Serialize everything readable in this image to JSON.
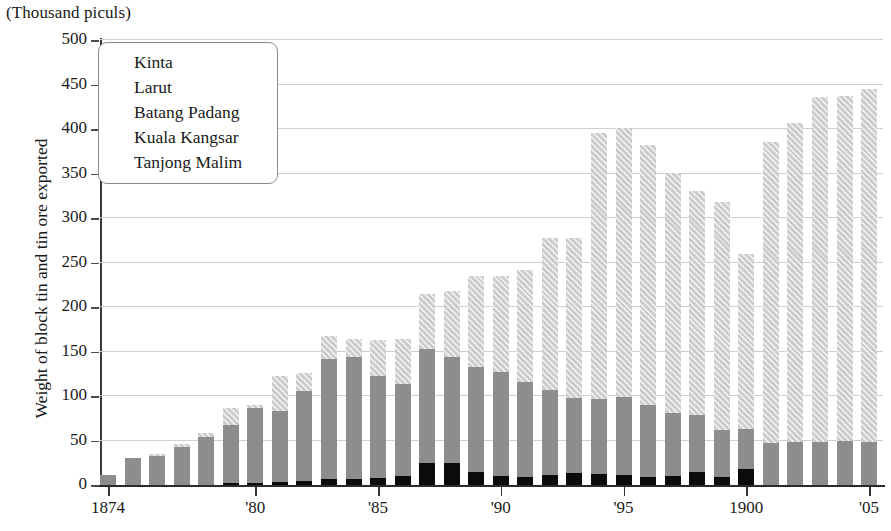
{
  "chart_data": {
    "type": "bar",
    "subtype": "stacked-bar",
    "title": "",
    "units_label": "(Thousand piculs)",
    "ylabel": "Weight of block tin and tin ore exported",
    "xlabel": "",
    "ylim": [
      0,
      500
    ],
    "ytick_labels": [
      "0",
      "50",
      "100",
      "150",
      "200",
      "250",
      "300",
      "350",
      "400",
      "450",
      "500"
    ],
    "ytick_values": [
      0,
      50,
      100,
      150,
      200,
      250,
      300,
      350,
      400,
      450,
      500
    ],
    "grid": true,
    "legend_position": "top-left",
    "x": [
      1874,
      1875,
      1876,
      1877,
      1878,
      1879,
      1880,
      1881,
      1882,
      1883,
      1884,
      1885,
      1886,
      1887,
      1888,
      1889,
      1890,
      1891,
      1892,
      1893,
      1894,
      1895,
      1896,
      1897,
      1898,
      1899,
      1900,
      1901,
      1902,
      1903,
      1904,
      1905
    ],
    "xtick_labels": [
      "1874",
      "'80",
      "'85",
      "'90",
      "'95",
      "1900",
      "'05"
    ],
    "xtick_values": [
      1874,
      1880,
      1885,
      1890,
      1895,
      1900,
      1905
    ],
    "series": [
      {
        "name": "Tanjong Malim",
        "color": "#7d7d7d",
        "values": [
          0,
          0,
          0,
          0,
          0,
          0,
          0,
          0,
          0,
          0,
          0,
          0,
          0,
          0,
          0,
          0,
          0,
          0,
          0,
          0,
          0,
          0,
          0,
          0,
          0,
          0,
          0,
          0,
          0,
          0,
          0,
          0
        ]
      },
      {
        "name": "Kuala Kangsar",
        "color": "#6f6f6f",
        "values": [
          0,
          0,
          0,
          0,
          0,
          0,
          0,
          0,
          0,
          0,
          0,
          0,
          0,
          0,
          0,
          0,
          0,
          0,
          0,
          0,
          0,
          0,
          0,
          0,
          0,
          0,
          0,
          0,
          0,
          0,
          0,
          0
        ]
      },
      {
        "name": "Batang Padang",
        "color": "#0b0b0b",
        "values": [
          0,
          0,
          0,
          0,
          0,
          2,
          2,
          3,
          5,
          7,
          7,
          8,
          10,
          25,
          25,
          15,
          10,
          9,
          11,
          13,
          12,
          11,
          9,
          10,
          15,
          9,
          18,
          0,
          0,
          0,
          0,
          0
        ]
      },
      {
        "name": "Larut",
        "color": "#8d8d8d",
        "values": [
          11,
          30,
          33,
          43,
          54,
          65,
          84,
          80,
          101,
          135,
          137,
          115,
          104,
          128,
          119,
          118,
          117,
          107,
          96,
          85,
          85,
          88,
          81,
          71,
          64,
          53,
          45,
          47,
          48,
          48,
          49,
          48
        ]
      },
      {
        "name": "Kinta",
        "color": "#cdcdcd",
        "values": [
          0,
          0,
          2,
          3,
          4,
          20,
          4,
          39,
          20,
          25,
          20,
          40,
          50,
          62,
          74,
          102,
          108,
          126,
          171,
          180,
          298,
          302,
          292,
          270,
          251,
          256,
          197,
          338,
          359,
          388,
          388,
          397
        ]
      }
    ],
    "totals": [
      11,
      30,
      35,
      46,
      58,
      87,
      90,
      122,
      126,
      167,
      164,
      163,
      164,
      215,
      218,
      235,
      235,
      242,
      278,
      278,
      395,
      401,
      382,
      351,
      330,
      318,
      260,
      385,
      407,
      436,
      437,
      445
    ]
  },
  "legend": {
    "items": [
      {
        "label": "Kinta",
        "color": "#cdcdcd",
        "pattern": "hatch"
      },
      {
        "label": "Larut",
        "color": "#8d8d8d",
        "pattern": "solid"
      },
      {
        "label": "Batang Padang",
        "color": "#0b0b0b",
        "pattern": "solid"
      },
      {
        "label": "Kuala Kangsar",
        "color": "#6f6f6f",
        "pattern": "solid"
      },
      {
        "label": "Tanjong Malim",
        "color": "#7d7d7d",
        "pattern": "hatch"
      }
    ]
  }
}
